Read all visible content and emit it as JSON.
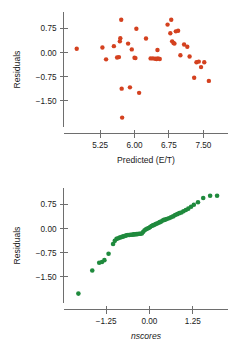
{
  "figure": {
    "title": "",
    "background": "#ffffff",
    "width": 233,
    "height": 352
  },
  "colors": {
    "residual_point": "#d4411f",
    "qq_point": "#1f8a3d",
    "axis": "#6e6e6e",
    "text": "#1a1a1a"
  },
  "chart_data": [
    {
      "type": "scatter",
      "title": "",
      "xlabel": "Predicted (E/T)",
      "ylabel": "Residuals",
      "xticks": [
        "5.25",
        "6.00",
        "6.75",
        "7.50"
      ],
      "xtick_values": [
        5.25,
        6.0,
        6.75,
        7.5
      ],
      "yticks": [
        "0.75",
        "0.00",
        "-0.75",
        "-1.50"
      ],
      "ytick_values": [
        0.75,
        0.0,
        -0.75,
        -1.5
      ],
      "xlim": [
        4.55,
        7.95
      ],
      "ylim": [
        -2.25,
        1.2
      ],
      "grid": false,
      "legend": "none",
      "marker_color": "#d4411f",
      "marker_size": 2.2,
      "points": [
        [
          4.74,
          0.12
        ],
        [
          5.3,
          0.16
        ],
        [
          5.38,
          -0.21
        ],
        [
          5.55,
          0.2
        ],
        [
          5.62,
          -0.15
        ],
        [
          5.66,
          -0.14
        ],
        [
          5.68,
          0.35
        ],
        [
          5.69,
          0.45
        ],
        [
          5.71,
          1.02
        ],
        [
          5.72,
          -1.12
        ],
        [
          5.73,
          -2.02
        ],
        [
          5.86,
          0.28
        ],
        [
          5.9,
          -1.08
        ],
        [
          5.94,
          0.1
        ],
        [
          6.0,
          -0.16
        ],
        [
          6.02,
          -0.17
        ],
        [
          6.04,
          0.74
        ],
        [
          6.1,
          -1.25
        ],
        [
          6.25,
          0.44
        ],
        [
          6.35,
          -0.18
        ],
        [
          6.4,
          -0.18
        ],
        [
          6.45,
          -0.19
        ],
        [
          6.48,
          -0.2
        ],
        [
          6.5,
          0.08
        ],
        [
          6.51,
          -0.18
        ],
        [
          6.55,
          -0.2
        ],
        [
          6.72,
          0.87
        ],
        [
          6.78,
          0.6
        ],
        [
          6.8,
          1.02
        ],
        [
          6.82,
          0.35
        ],
        [
          6.85,
          0.3
        ],
        [
          6.87,
          0.28
        ],
        [
          6.9,
          0.66
        ],
        [
          6.95,
          0.68
        ],
        [
          7.0,
          -0.08
        ],
        [
          7.08,
          0.25
        ],
        [
          7.15,
          0.18
        ],
        [
          7.2,
          -0.12
        ],
        [
          7.3,
          -0.78
        ],
        [
          7.35,
          -0.3
        ],
        [
          7.4,
          -0.28
        ],
        [
          7.45,
          -0.45
        ],
        [
          7.52,
          -0.3
        ],
        [
          7.62,
          -0.88
        ]
      ]
    },
    {
      "type": "scatter",
      "title": "",
      "xlabel": "nscores",
      "ylabel": "Residuals",
      "xlabel_italic": true,
      "xticks": [
        "-1.25",
        "0.00",
        "1.25"
      ],
      "xtick_values": [
        -1.25,
        0.0,
        1.25
      ],
      "yticks": [
        "0.75",
        "0.00",
        "-0.75",
        "-1.50"
      ],
      "ytick_values": [
        0.75,
        0.0,
        -0.75,
        -1.5
      ],
      "xlim": [
        -2.35,
        2.15
      ],
      "ylim": [
        -2.25,
        1.2
      ],
      "grid": false,
      "legend": "none",
      "marker_color": "#1f8a3d",
      "marker_size": 2.3,
      "points": [
        [
          -2.05,
          -2.02
        ],
        [
          -1.65,
          -1.3
        ],
        [
          -1.45,
          -1.06
        ],
        [
          -1.37,
          -1.04
        ],
        [
          -1.3,
          -0.98
        ],
        [
          -1.18,
          -0.78
        ],
        [
          -1.05,
          -0.48
        ],
        [
          -1.0,
          -0.38
        ],
        [
          -0.95,
          -0.32
        ],
        [
          -0.9,
          -0.3
        ],
        [
          -0.86,
          -0.28
        ],
        [
          -0.82,
          -0.27
        ],
        [
          -0.78,
          -0.25
        ],
        [
          -0.74,
          -0.24
        ],
        [
          -0.7,
          -0.22
        ],
        [
          -0.66,
          -0.21
        ],
        [
          -0.62,
          -0.2
        ],
        [
          -0.58,
          -0.2
        ],
        [
          -0.54,
          -0.19
        ],
        [
          -0.5,
          -0.19
        ],
        [
          -0.46,
          -0.18
        ],
        [
          -0.42,
          -0.18
        ],
        [
          -0.38,
          -0.17
        ],
        [
          -0.34,
          -0.17
        ],
        [
          -0.3,
          -0.16
        ],
        [
          -0.26,
          -0.16
        ],
        [
          -0.22,
          -0.15
        ],
        [
          -0.18,
          -0.1
        ],
        [
          -0.14,
          -0.05
        ],
        [
          -0.1,
          -0.02
        ],
        [
          -0.06,
          0.0
        ],
        [
          -0.02,
          0.02
        ],
        [
          0.02,
          0.05
        ],
        [
          0.06,
          0.08
        ],
        [
          0.1,
          0.1
        ],
        [
          0.14,
          0.12
        ],
        [
          0.18,
          0.14
        ],
        [
          0.22,
          0.16
        ],
        [
          0.26,
          0.18
        ],
        [
          0.3,
          0.2
        ],
        [
          0.34,
          0.22
        ],
        [
          0.38,
          0.25
        ],
        [
          0.42,
          0.27
        ],
        [
          0.46,
          0.28
        ],
        [
          0.5,
          0.3
        ],
        [
          0.56,
          0.32
        ],
        [
          0.62,
          0.35
        ],
        [
          0.68,
          0.38
        ],
        [
          0.74,
          0.42
        ],
        [
          0.8,
          0.45
        ],
        [
          0.86,
          0.48
        ],
        [
          0.92,
          0.5
        ],
        [
          0.98,
          0.54
        ],
        [
          1.05,
          0.58
        ],
        [
          1.12,
          0.62
        ],
        [
          1.2,
          0.68
        ],
        [
          1.28,
          0.74
        ],
        [
          1.4,
          0.82
        ],
        [
          1.55,
          0.95
        ],
        [
          1.75,
          1.02
        ],
        [
          1.95,
          1.02
        ]
      ]
    }
  ]
}
